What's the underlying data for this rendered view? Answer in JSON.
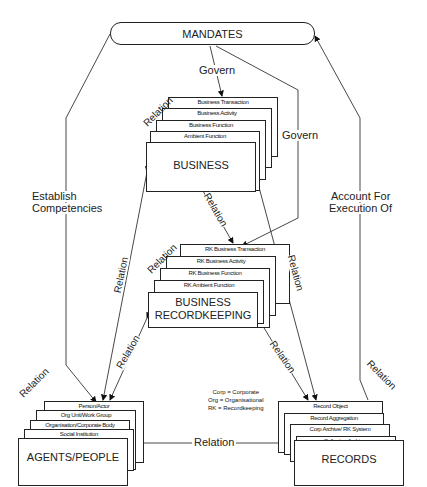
{
  "diagram": {
    "mandates": {
      "label": "MANDATES"
    },
    "business": {
      "label": "BUSINESS",
      "layers": [
        "Business Transaction",
        "Business Activity",
        "Business Function",
        "Ambient Function"
      ]
    },
    "recordkeeping": {
      "label_line1": "BUSINESS",
      "label_line2": "RECORDKEEPING",
      "layers": [
        "RK Business Transaction",
        "RK Business Activity",
        "RK Business Function",
        "RK Ambient Function"
      ]
    },
    "agents": {
      "label": "AGENTS/PEOPLE",
      "layers": [
        "Person/Actor",
        "Org Unit/Work Group",
        "Organisation/Corporate Body",
        "Social Institution"
      ]
    },
    "records": {
      "label": "RECORDS",
      "layers": [
        "Record Object",
        "Record Aggregation",
        "Corp Archive/ RK System",
        "Collective Archives"
      ]
    },
    "edges": {
      "govern_business": "Govern",
      "govern_rk": "Govern",
      "establish_line1": "Establish",
      "establish_line2": "Competencies",
      "account_line1": "Account For",
      "account_line2": "Execution Of",
      "relation": "Relation"
    },
    "legend": {
      "items": [
        "Corp = Corporate",
        "Org = Organisational",
        "RK = Recordkeeping"
      ]
    }
  }
}
